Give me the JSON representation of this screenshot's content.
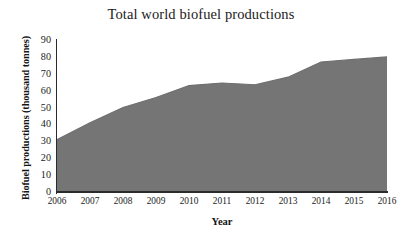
{
  "chart_data": {
    "type": "area",
    "title": "Total world biofuel productions",
    "xlabel": "Year",
    "ylabel": "Biofuel productions (thousand tonnes)",
    "categories": [
      "2006",
      "2007",
      "2008",
      "2009",
      "2010",
      "2011",
      "2012",
      "2013",
      "2014",
      "2015",
      "2016"
    ],
    "x": [
      2006,
      2007,
      2008,
      2009,
      2010,
      2011,
      2012,
      2013,
      2014,
      2015,
      2016
    ],
    "values": [
      31,
      41,
      50,
      56,
      63,
      64.5,
      63.5,
      68,
      77,
      78.5,
      80
    ],
    "series": [
      {
        "name": "Total world biofuel productions",
        "values": [
          31,
          41,
          50,
          56,
          63,
          64.5,
          63.5,
          68,
          77,
          78.5,
          80
        ]
      }
    ],
    "ylim": [
      0,
      90
    ],
    "ytick_labels": [
      "90",
      "80",
      "70",
      "60",
      "50",
      "40",
      "30",
      "20",
      "10",
      "0"
    ],
    "ytick_values": [
      90,
      80,
      70,
      60,
      50,
      40,
      30,
      20,
      10,
      0
    ],
    "ytick_step": 10,
    "xlim": [
      2006,
      2016
    ],
    "grid": false,
    "legend": false,
    "legend_position": "none",
    "fill_color": "#757575",
    "line_color": "#6e6e6e",
    "axis_color": "#2b2b2b",
    "background_color": "#ffffff",
    "text_color": "#1b1b1b"
  }
}
